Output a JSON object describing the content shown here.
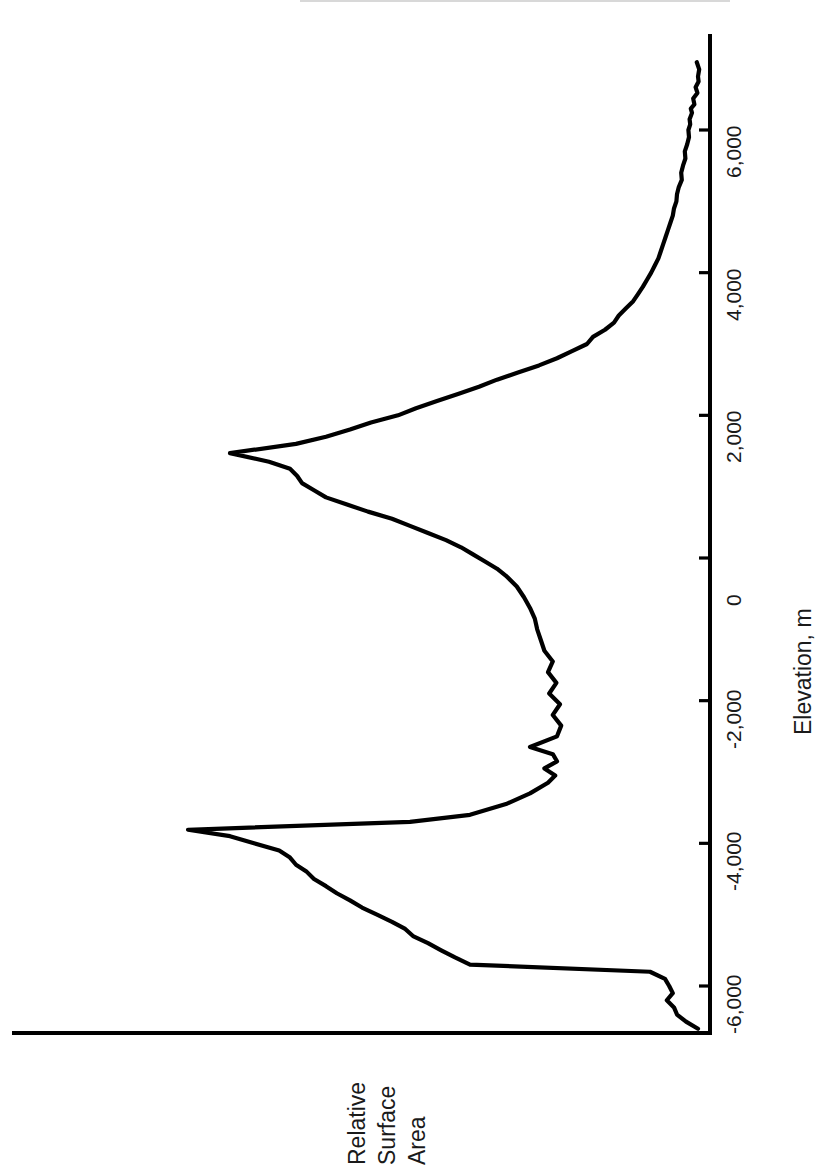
{
  "figure": {
    "orientation": "rotated-90-ccw",
    "background_color": "#ffffff",
    "line_color": "#000000",
    "axis_color": "#000000"
  },
  "axes": {
    "elevation_axis": {
      "title": "Elevation, m",
      "unit": "m",
      "tick_labels": [
        "6,000",
        "4,000",
        "2,000",
        "0",
        "-2,000",
        "-4,000",
        "-6,000"
      ],
      "tick_values": [
        6000,
        4000,
        2000,
        0,
        -2000,
        -4000,
        -6000
      ],
      "range": [
        -6700,
        7000
      ]
    },
    "area_axis": {
      "title_lines": [
        "Relative",
        "Surface",
        "Area"
      ],
      "title": "Relative Surface Area",
      "tick_labels": [],
      "range": [
        0,
        1
      ]
    }
  },
  "chart_data": {
    "type": "line",
    "title": "",
    "subtitle": "",
    "xlabel": "Elevation, m",
    "ylabel": "Relative Surface Area",
    "xlim": [
      -6700,
      7000
    ],
    "ylim": [
      0,
      1
    ],
    "grid": false,
    "legend": null,
    "annotations": [],
    "series": [
      {
        "name": "Relative Surface Area",
        "x": [
          6950,
          6850,
          6750,
          6680,
          6600,
          6520,
          6440,
          6360,
          6300,
          6240,
          6150,
          6080,
          6000,
          5900,
          5800,
          5700,
          5600,
          5500,
          5400,
          5300,
          5200,
          5100,
          5000,
          4900,
          4800,
          4700,
          4600,
          4500,
          4400,
          4300,
          4200,
          4100,
          4000,
          3900,
          3800,
          3700,
          3600,
          3500,
          3400,
          3300,
          3200,
          3100,
          3000,
          2900,
          2800,
          2700,
          2600,
          2500,
          2400,
          2300,
          2200,
          2100,
          2000,
          1900,
          1800,
          1700,
          1600,
          1470,
          1350,
          1250,
          1150,
          1050,
          950,
          850,
          750,
          650,
          550,
          450,
          350,
          250,
          150,
          50,
          -50,
          -150,
          -250,
          -400,
          -550,
          -700,
          -850,
          -1000,
          -1150,
          -1300,
          -1450,
          -1600,
          -1750,
          -1900,
          -2050,
          -2200,
          -2350,
          -2500,
          -2650,
          -2750,
          -2850,
          -2950,
          -3050,
          -3150,
          -3300,
          -3450,
          -3600,
          -3700,
          -3810,
          -3900,
          -4000,
          -4100,
          -4200,
          -4300,
          -4400,
          -4500,
          -4600,
          -4700,
          -4800,
          -4900,
          -5000,
          -5100,
          -5200,
          -5300,
          -5400,
          -5500,
          -5600,
          -5700,
          -5800,
          -5900,
          -6000,
          -6100,
          -6200,
          -6300,
          -6400,
          -6500,
          -6600
        ],
        "y": [
          0.022,
          0.018,
          0.02,
          0.019,
          0.024,
          0.021,
          0.028,
          0.026,
          0.032,
          0.03,
          0.034,
          0.033,
          0.036,
          0.035,
          0.038,
          0.042,
          0.041,
          0.045,
          0.048,
          0.047,
          0.052,
          0.055,
          0.056,
          0.06,
          0.062,
          0.066,
          0.07,
          0.074,
          0.078,
          0.082,
          0.086,
          0.092,
          0.098,
          0.105,
          0.112,
          0.12,
          0.128,
          0.14,
          0.152,
          0.16,
          0.175,
          0.195,
          0.205,
          0.23,
          0.255,
          0.285,
          0.32,
          0.355,
          0.385,
          0.42,
          0.455,
          0.49,
          0.52,
          0.565,
          0.6,
          0.64,
          0.69,
          0.8,
          0.735,
          0.7,
          0.688,
          0.68,
          0.66,
          0.64,
          0.605,
          0.57,
          0.53,
          0.5,
          0.47,
          0.44,
          0.415,
          0.395,
          0.375,
          0.355,
          0.34,
          0.322,
          0.31,
          0.3,
          0.292,
          0.288,
          0.282,
          0.276,
          0.262,
          0.27,
          0.256,
          0.268,
          0.25,
          0.262,
          0.248,
          0.255,
          0.3,
          0.262,
          0.255,
          0.276,
          0.258,
          0.27,
          0.3,
          0.34,
          0.4,
          0.5,
          0.87,
          0.8,
          0.76,
          0.718,
          0.7,
          0.69,
          0.672,
          0.66,
          0.64,
          0.622,
          0.6,
          0.58,
          0.555,
          0.53,
          0.508,
          0.495,
          0.47,
          0.448,
          0.425,
          0.4,
          0.1,
          0.075,
          0.068,
          0.062,
          0.072,
          0.06,
          0.055,
          0.04,
          0.02
        ]
      }
    ]
  }
}
